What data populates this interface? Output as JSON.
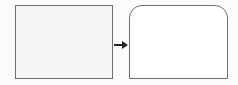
{
  "diagram": {
    "type": "shape-transformation",
    "nodes": [
      {
        "id": "left",
        "shape": "rectangle",
        "label": ""
      },
      {
        "id": "right",
        "shape": "rectangle-rounded-top",
        "label": ""
      }
    ],
    "edges": [
      {
        "from": "left",
        "to": "right",
        "style": "arrow"
      }
    ],
    "colors": {
      "stroke": "#6e6e6e",
      "arrow": "#222222",
      "left_fill": "#f4f4f4",
      "right_fill": "#ffffff"
    }
  }
}
